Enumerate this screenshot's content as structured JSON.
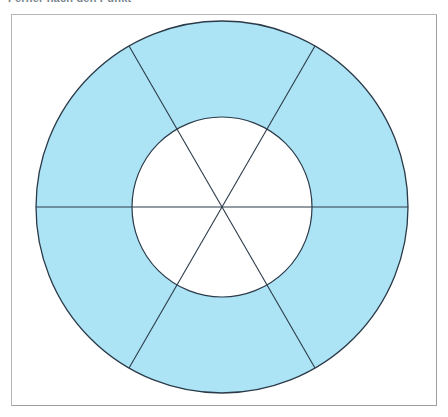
{
  "caption": {
    "text": "Ferner nach den Punkt"
  },
  "frame": {
    "label": "figure-box",
    "border_color": "#b3b5b6",
    "background": "#ffffff"
  },
  "figure": {
    "shape": "annulus",
    "fill_color": "#ace4f6",
    "stroke_color": "#2b3a48",
    "hole_fill": "#ffffff",
    "center": {
      "x": 222,
      "y": 207
    },
    "outer_radius": 186,
    "inner_radius": 90,
    "sector_count": 6,
    "sector_angle_degrees": 60,
    "divider_angles_degrees": [
      0,
      60,
      120
    ],
    "dividers_span": "full-diameter",
    "stroke_width": 1.1
  },
  "chart_data": {
    "type": "pie",
    "subtitle": "",
    "xlabel": "",
    "ylabel": "",
    "categories": [
      "1",
      "2",
      "3",
      "4",
      "5",
      "6"
    ],
    "values": [
      60,
      60,
      60,
      60,
      60,
      60
    ],
    "units": "degrees",
    "inner_radius_ratio": 0.484,
    "grid": false,
    "legend": "none",
    "colors": [
      "#ace4f6",
      "#ace4f6",
      "#ace4f6",
      "#ace4f6",
      "#ace4f6",
      "#ace4f6"
    ],
    "annotations": []
  }
}
